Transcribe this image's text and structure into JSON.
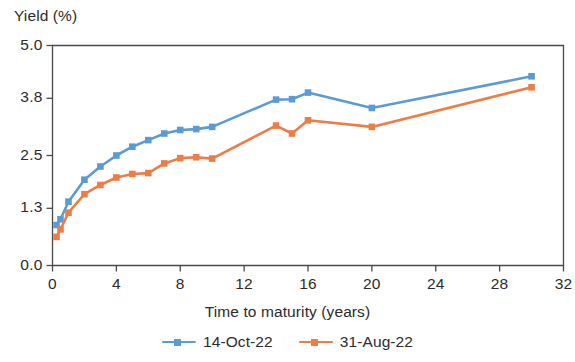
{
  "chart_data": {
    "type": "line",
    "title": "",
    "xlabel": "Time to maturity (years)",
    "ylabel": "Yield (%)",
    "xlim": [
      0,
      32
    ],
    "ylim": [
      0.0,
      5.0
    ],
    "xticks": [
      0,
      4,
      8,
      12,
      16,
      20,
      24,
      28,
      32
    ],
    "xtick_labels": [
      "0",
      "4",
      "8",
      "12",
      "16",
      "20",
      "24",
      "28",
      "32"
    ],
    "yticks": [
      0.0,
      1.3,
      2.5,
      3.8,
      5.0
    ],
    "ytick_labels": [
      "0.0",
      "1.3",
      "2.5",
      "3.8",
      "5.0"
    ],
    "grid": false,
    "legend_position": "bottom",
    "series": [
      {
        "name": "14-Oct-22",
        "color": "#5B9BD5",
        "marker": "square",
        "x": [
          0.25,
          0.5,
          1,
          2,
          3,
          4,
          5,
          6,
          7,
          8,
          9,
          10,
          14,
          15,
          16,
          20,
          30
        ],
        "values": [
          0.92,
          1.05,
          1.45,
          1.95,
          2.25,
          2.5,
          2.7,
          2.85,
          3.0,
          3.08,
          3.1,
          3.15,
          3.77,
          3.78,
          3.93,
          3.58,
          4.3
        ]
      },
      {
        "name": "31-Aug-22",
        "color": "#ED7D47",
        "marker": "square",
        "x": [
          0.25,
          0.5,
          1,
          2,
          3,
          4,
          5,
          6,
          7,
          8,
          9,
          10,
          14,
          15,
          16,
          20,
          30
        ],
        "values": [
          0.65,
          0.82,
          1.2,
          1.62,
          1.83,
          2.0,
          2.08,
          2.1,
          2.32,
          2.44,
          2.46,
          2.43,
          3.18,
          3.0,
          3.3,
          3.15,
          4.05
        ]
      }
    ]
  },
  "legend": {
    "entries": [
      {
        "label": "14-Oct-22",
        "color": "#5B9BD5"
      },
      {
        "label": "31-Aug-22",
        "color": "#ED7D47"
      }
    ]
  },
  "axes": {
    "frame_color": "#4a4a4a",
    "tick_color": "#4a4a4a"
  }
}
